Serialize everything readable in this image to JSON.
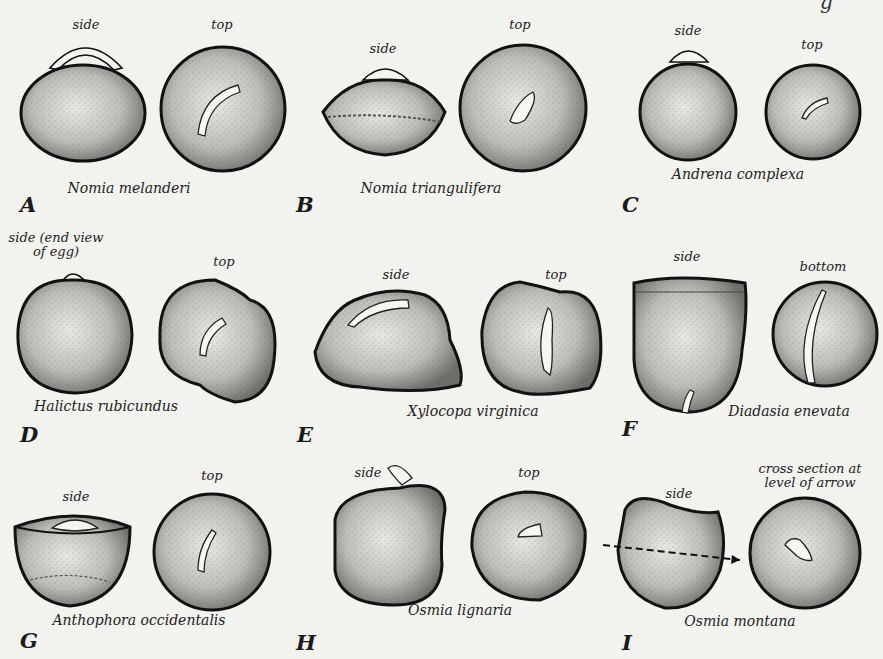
{
  "figure": {
    "top_fragment_text": "g",
    "panels": [
      {
        "letter": "A",
        "species": "Nomia melanderi",
        "views": [
          "side",
          "top"
        ]
      },
      {
        "letter": "B",
        "species": "Nomia triangulifera",
        "views": [
          "side",
          "top"
        ]
      },
      {
        "letter": "C",
        "species": "Andrena complexa",
        "views": [
          "side",
          "top"
        ]
      },
      {
        "letter": "D",
        "species": "Halictus rubicundus",
        "views": [
          "side (end view of egg)",
          "top"
        ]
      },
      {
        "letter": "E",
        "species": "Xylocopa virginica",
        "views": [
          "side",
          "top"
        ]
      },
      {
        "letter": "F",
        "species": "Diadasia enevata",
        "views": [
          "side",
          "bottom"
        ]
      },
      {
        "letter": "G",
        "species": "Anthophora occidentalis",
        "views": [
          "side",
          "top"
        ]
      },
      {
        "letter": "H",
        "species": "Osmia lignaria",
        "views": [
          "side",
          "top"
        ]
      },
      {
        "letter": "I",
        "species": "Osmia montana",
        "views": [
          "side",
          "cross section at level of arrow"
        ]
      }
    ],
    "d_side_line1": "side (end view",
    "d_side_line2": "of egg)",
    "i_cross_line1": "cross section at",
    "i_cross_line2": "level of arrow"
  }
}
